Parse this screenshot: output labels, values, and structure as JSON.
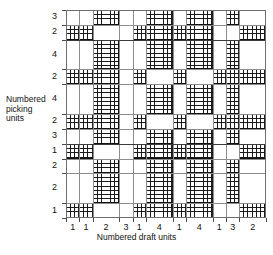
{
  "axes": {
    "y_caption": "Numbered\npicking\nunits",
    "x_caption": "Numbered draft units",
    "x_ticklabels": [
      "1",
      "1",
      "2",
      "3",
      "1",
      "4",
      "1",
      "4",
      "1",
      "3",
      "2"
    ],
    "y_ticklabels": [
      "3",
      "2",
      "4",
      "2",
      "4",
      "2",
      "3",
      "1",
      "2",
      "2",
      "1"
    ]
  },
  "chart_data": {
    "type": "heatmap",
    "title": "",
    "xlabel": "Numbered draft units",
    "ylabel": "Numbered picking units",
    "grid": true,
    "legend": "none",
    "colors": {
      "filled": "#1a1a1a",
      "empty": "#ffffff",
      "gridline": "#8d8d8d",
      "frame": "#6e6e6e"
    },
    "cell_fill_style": "cross-hatch",
    "columns": [
      {
        "label": "1",
        "units": 1
      },
      {
        "label": "1",
        "units": 1
      },
      {
        "label": "2",
        "units": 2
      },
      {
        "label": "3",
        "units": 1
      },
      {
        "label": "1",
        "units": 1
      },
      {
        "label": "4",
        "units": 2
      },
      {
        "label": "1",
        "units": 1
      },
      {
        "label": "4",
        "units": 2
      },
      {
        "label": "1",
        "units": 1
      },
      {
        "label": "3",
        "units": 1
      },
      {
        "label": "2",
        "units": 2
      }
    ],
    "rows": [
      {
        "label": "3",
        "units": 1
      },
      {
        "label": "2",
        "units": 1
      },
      {
        "label": "4",
        "units": 2
      },
      {
        "label": "2",
        "units": 1
      },
      {
        "label": "4",
        "units": 2
      },
      {
        "label": "2",
        "units": 1
      },
      {
        "label": "3",
        "units": 1
      },
      {
        "label": "1",
        "units": 1
      },
      {
        "label": "2",
        "units": 1
      },
      {
        "label": "2",
        "units": 2
      },
      {
        "label": "1",
        "units": 1
      }
    ],
    "matrix": [
      [
        0,
        0,
        1,
        0,
        0,
        1,
        0,
        1,
        0,
        1,
        0
      ],
      [
        1,
        1,
        0,
        0,
        1,
        1,
        1,
        1,
        0,
        0,
        1
      ],
      [
        0,
        0,
        1,
        0,
        0,
        1,
        0,
        1,
        0,
        1,
        0
      ],
      [
        1,
        1,
        1,
        0,
        1,
        0,
        1,
        0,
        1,
        1,
        1
      ],
      [
        0,
        0,
        1,
        0,
        0,
        1,
        0,
        1,
        0,
        1,
        0
      ],
      [
        1,
        1,
        1,
        0,
        1,
        0,
        1,
        0,
        1,
        1,
        1
      ],
      [
        0,
        0,
        1,
        0,
        0,
        1,
        0,
        1,
        0,
        1,
        0
      ],
      [
        1,
        1,
        0,
        0,
        1,
        1,
        1,
        1,
        0,
        0,
        1
      ],
      [
        0,
        0,
        1,
        0,
        0,
        1,
        0,
        1,
        0,
        1,
        0
      ],
      [
        0,
        0,
        1,
        0,
        0,
        1,
        0,
        1,
        0,
        1,
        0
      ],
      [
        1,
        1,
        0,
        0,
        1,
        1,
        1,
        1,
        0,
        0,
        1
      ]
    ]
  }
}
